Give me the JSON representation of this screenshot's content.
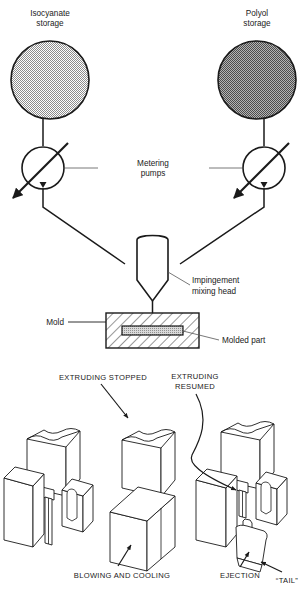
{
  "diagram": {
    "top_process": {
      "tanks": [
        {
          "id": "isocyanate",
          "label_line1": "Isocyanate",
          "label_line2": "storage",
          "fill_color": "#d4d4d4"
        },
        {
          "id": "polyol",
          "label_line1": "Polyol",
          "label_line2": "storage",
          "fill_color": "#949494"
        }
      ],
      "pumps_label_line1": "Metering",
      "pumps_label_line2": "pumps",
      "mixing_head_label_line1": "Impingement",
      "mixing_head_label_line2": "mixing head",
      "mold_label": "Mold",
      "molded_part_label": "Molded part"
    },
    "bottom_process": {
      "stage_labels": [
        {
          "id": "extruding-stopped",
          "text": "EXTRUDING STOPPED"
        },
        {
          "id": "extruding-resumed-line1",
          "text": "EXTRUDING"
        },
        {
          "id": "extruding-resumed-line2",
          "text": "RESUMED"
        },
        {
          "id": "blowing-and-cooling",
          "text": "BLOWING AND COOLING"
        },
        {
          "id": "ejection",
          "text": "EJECTION"
        },
        {
          "id": "tail",
          "text": "“TAIL”"
        }
      ]
    },
    "colors": {
      "line": "#1a1a1a",
      "background": "#ffffff",
      "part_fill": "#c8c8c8"
    }
  }
}
